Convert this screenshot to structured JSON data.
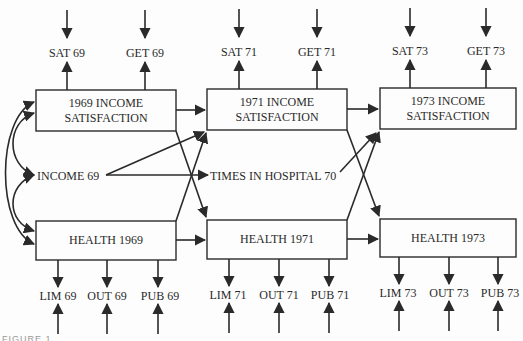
{
  "diagram": {
    "type": "path-model",
    "colors": {
      "ink": "#2a2a2a",
      "background": "#fdfdfd"
    },
    "latent_boxes": {
      "sat69": {
        "line1": "1969 INCOME",
        "line2": "SATISFACTION"
      },
      "sat71": {
        "line1": "1971 INCOME",
        "line2": "SATISFACTION"
      },
      "sat73": {
        "line1": "1973 INCOME",
        "line2": "SATISFACTION"
      },
      "health69": {
        "label": "HEALTH 1969"
      },
      "health71": {
        "label": "HEALTH 1971"
      },
      "health73": {
        "label": "HEALTH 1973"
      }
    },
    "exogenous": {
      "income69": "INCOME 69",
      "hospital70": "TIMES IN HOSPITAL 70"
    },
    "top_indicators": [
      "SAT 69",
      "GET 69",
      "SAT 71",
      "GET 71",
      "SAT 73",
      "GET 73"
    ],
    "bottom_indicators": [
      "LIM 69",
      "OUT 69",
      "PUB 69",
      "LIM 71",
      "OUT 71",
      "PUB 71",
      "LIM 73",
      "OUT 73",
      "PUB 73"
    ],
    "caption": "FIGURE 1"
  }
}
